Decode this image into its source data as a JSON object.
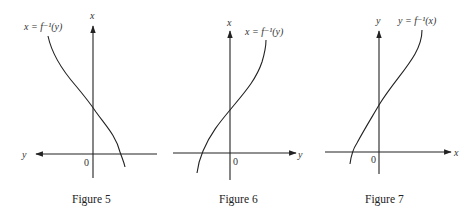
{
  "figures": [
    {
      "id": "figure-5",
      "caption": "Figure 5",
      "vertical_axis_label": "x",
      "horizontal_axis_label": "y",
      "horizontal_arrow_direction": "left",
      "origin_label": "0",
      "curve_label": "x = f⁻¹(y)",
      "curve_shape": "decreasing, crosses vertical axis above origin and horizontal axis right of origin"
    },
    {
      "id": "figure-6",
      "caption": "Figure 6",
      "vertical_axis_label": "x",
      "horizontal_axis_label": "y",
      "horizontal_arrow_direction": "right",
      "origin_label": "0",
      "curve_label": "x = f⁻¹(y)",
      "curve_shape": "increasing, crosses vertical axis above origin and horizontal axis left of origin"
    },
    {
      "id": "figure-7",
      "caption": "Figure 7",
      "vertical_axis_label": "y",
      "horizontal_axis_label": "x",
      "horizontal_arrow_direction": "right",
      "origin_label": "0",
      "curve_label": "y = f⁻¹(x)",
      "curve_shape": "increasing, crosses vertical axis above origin and horizontal axis left of origin"
    }
  ]
}
